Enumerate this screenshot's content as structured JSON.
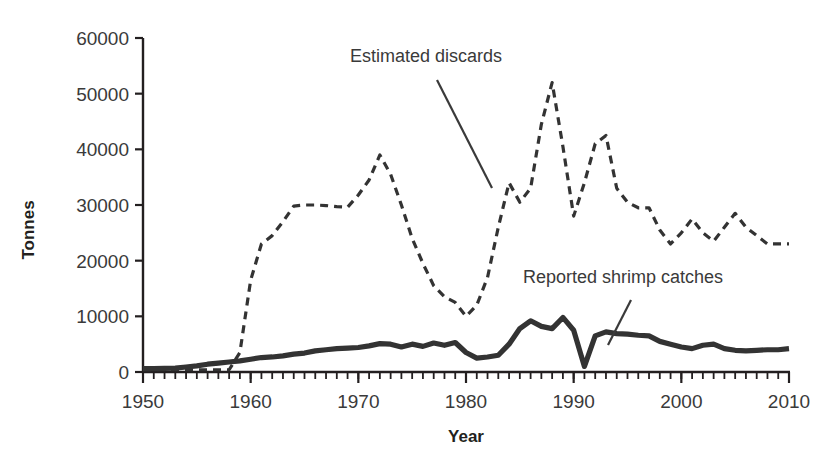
{
  "chart_data": {
    "type": "line",
    "title": "",
    "xlabel": "Year",
    "ylabel": "Tonnes",
    "xlim": [
      1950,
      2010
    ],
    "ylim": [
      0,
      60000
    ],
    "grid": false,
    "legend_position": "inline-annotations",
    "x_ticks": [
      1950,
      1960,
      1970,
      1980,
      1990,
      2000,
      2010
    ],
    "x_tick_labels": [
      "1950",
      "1960",
      "1970",
      "1980",
      "1990",
      "2000",
      "2010"
    ],
    "x_minor_tick_step": 1,
    "y_ticks": [
      0,
      10000,
      20000,
      30000,
      40000,
      50000,
      60000
    ],
    "y_tick_labels": [
      "0",
      "10000",
      "20000",
      "30000",
      "40000",
      "50000",
      "60000"
    ],
    "x": [
      1950,
      1951,
      1952,
      1953,
      1954,
      1955,
      1956,
      1957,
      1958,
      1959,
      1960,
      1961,
      1962,
      1963,
      1964,
      1965,
      1966,
      1967,
      1968,
      1969,
      1970,
      1971,
      1972,
      1973,
      1974,
      1975,
      1976,
      1977,
      1978,
      1979,
      1980,
      1981,
      1982,
      1983,
      1984,
      1985,
      1986,
      1987,
      1988,
      1989,
      1990,
      1991,
      1992,
      1993,
      1994,
      1995,
      1996,
      1997,
      1998,
      1999,
      2000,
      2001,
      2002,
      2003,
      2004,
      2005,
      2006,
      2007,
      2008,
      2009,
      2010
    ],
    "series": [
      {
        "name": "Estimated discards",
        "style": "dashed",
        "color": "#333333",
        "values": [
          400,
          400,
          400,
          400,
          400,
          400,
          400,
          400,
          400,
          3500,
          16500,
          23000,
          24500,
          27000,
          29800,
          30000,
          30000,
          29900,
          29700,
          29600,
          31800,
          34500,
          39000,
          35500,
          30000,
          24000,
          19500,
          15500,
          13500,
          12500,
          10000,
          12000,
          17000,
          26000,
          34000,
          30500,
          33000,
          44500,
          52000,
          40500,
          28000,
          34000,
          41000,
          42500,
          33000,
          30500,
          29500,
          29500,
          25500,
          23000,
          25000,
          27500,
          25000,
          23500,
          26000,
          28500,
          26000,
          24500,
          23000,
          23000,
          23000
        ]
      },
      {
        "name": "Reported shrimp catches",
        "style": "solid",
        "color": "#333333",
        "values": [
          600,
          600,
          650,
          700,
          900,
          1100,
          1400,
          1600,
          1800,
          2000,
          2300,
          2600,
          2700,
          2900,
          3200,
          3400,
          3800,
          4000,
          4200,
          4300,
          4400,
          4700,
          5100,
          5000,
          4500,
          5000,
          4600,
          5200,
          4800,
          5300,
          3500,
          2500,
          2700,
          3000,
          5000,
          7800,
          9200,
          8200,
          7800,
          9800,
          7500,
          1000,
          6500,
          7200,
          6900,
          6800,
          6600,
          6500,
          5500,
          5000,
          4500,
          4200,
          4800,
          5000,
          4200,
          3900,
          3800,
          3900,
          4000,
          4000,
          4200
        ]
      }
    ],
    "annotations": [
      {
        "text": "Estimated discards",
        "label_x": 350,
        "label_y": 62,
        "leader_from_x": 437,
        "leader_from_y": 80,
        "leader_to_x": 492,
        "leader_to_y": 188
      },
      {
        "text": "Reported shrimp catches",
        "label_x": 523,
        "label_y": 283,
        "leader_from_x": 631,
        "leader_from_y": 300,
        "leader_to_x": 608,
        "leader_to_y": 345
      }
    ]
  }
}
